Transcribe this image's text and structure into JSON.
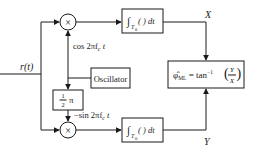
{
  "diagram": {
    "input": {
      "label": "r(t)"
    },
    "upper_branch": {
      "multiplier": {
        "symbol": "×"
      },
      "reference_label": "cos 2πf",
      "reference_sub": "c",
      "reference_tail": " t",
      "integrator": {
        "int_sym": "∫",
        "limit": "T",
        "limit_sub": "0",
        "body": "( ) dt"
      },
      "output_label": "X"
    },
    "oscillator": {
      "label": "Oscillator"
    },
    "phase_shift": {
      "frac_num": "1",
      "frac_den": "2",
      "symbol": "π"
    },
    "lower_branch": {
      "multiplier": {
        "symbol": "×"
      },
      "reference_label": "−sin 2πf",
      "reference_sub": "c",
      "reference_tail": " t",
      "integrator": {
        "int_sym": "∫",
        "limit": "T",
        "limit_sub": "0",
        "body": "( ) dt"
      },
      "output_label": "Y"
    },
    "estimator": {
      "phi": "φ̂",
      "sub": "ML",
      "eq": " = tan",
      "sup": "−1",
      "num": "Y",
      "den": "X"
    }
  }
}
